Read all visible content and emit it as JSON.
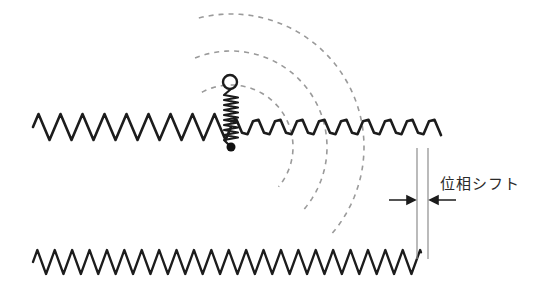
{
  "figure": {
    "background_color": "#ffffff",
    "width": 547,
    "height": 297
  },
  "colors": {
    "wave_stroke": "#1c1c1c",
    "arc_stroke": "#9a9a9a",
    "guide_line_stroke": "#8d8d8d",
    "arrow_stroke": "#1c1c1c",
    "oscillator_stroke": "#1c1c1c",
    "dot_fill": "#111111",
    "text": "#2a2a2a"
  },
  "labels": {
    "phase_shift": "位相シフト"
  },
  "chart_data": {
    "type": "line",
    "title": "",
    "xlabel": "",
    "ylabel": "",
    "grid": false,
    "legend": "none",
    "annotations": [
      {
        "name": "phase-shift-label",
        "text": "位相シフト",
        "x": 440,
        "y": 189
      }
    ],
    "series": [
      {
        "name": "upper-wave-before-oscillator",
        "kind": "triangle-wave",
        "x_start": 33,
        "x_end": 231,
        "baseline_y": 127,
        "amplitude": 13,
        "wavelength": 22,
        "phase_deg": 0,
        "stroke_width": 2.6
      },
      {
        "name": "upper-wave-after-oscillator",
        "kind": "triangle-wave",
        "x_start": 231,
        "x_end": 441,
        "baseline_y": 127,
        "amplitude": 13,
        "wavelength": 22,
        "phase_deg": 40,
        "stroke_width": 2.6
      },
      {
        "name": "lower-reference-wave",
        "kind": "triangle-wave",
        "x_start": 33,
        "x_end": 421,
        "baseline_y": 262,
        "amplitude": 12,
        "wavelength": 17.4,
        "phase_deg": 0,
        "stroke_width": 2.3
      }
    ],
    "wavefronts": [
      {
        "name": "wavefront-inner",
        "center_x": 231,
        "center_y": 147,
        "radius": 62,
        "start_angle_deg": -118,
        "end_angle_deg": 40,
        "dash": "5 5"
      },
      {
        "name": "wavefront-middle",
        "center_x": 231,
        "center_y": 147,
        "radius": 96,
        "start_angle_deg": -112,
        "end_angle_deg": 43,
        "dash": "5 5"
      },
      {
        "name": "wavefront-outer",
        "center_x": 231,
        "center_y": 147,
        "radius": 133,
        "start_angle_deg": -104,
        "end_angle_deg": 42,
        "dash": "5 5"
      }
    ],
    "oscillator": {
      "name": "oscillator",
      "anchor_x": 231,
      "anchor_y": 147,
      "coil_top_y": 95,
      "coil_bottom_y": 140,
      "coil_half_width": 7,
      "coil_turns": 9,
      "bob_center_x": 230,
      "bob_center_y": 82,
      "bob_radius": 7,
      "dot_radius": 4.5
    },
    "measure": {
      "name": "phase-shift-measure",
      "left_line_x": 417,
      "right_line_x": 428,
      "line_top_y": 148,
      "line_bottom_y": 259,
      "arrow_y": 200,
      "left_arrow_tail_x": 389,
      "left_arrow_head_x": 415,
      "right_arrow_tail_x": 456,
      "right_arrow_head_x": 430
    }
  }
}
